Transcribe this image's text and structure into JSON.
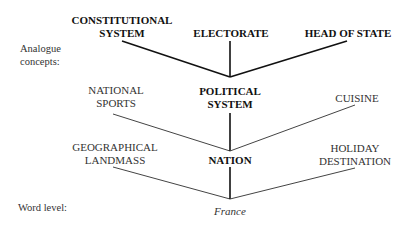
{
  "side_labels": {
    "analogue": [
      "Analogue",
      "concepts:"
    ],
    "word_level": "Word level:"
  },
  "level_top": {
    "nodes": [
      {
        "lines": [
          "CONSTITUTIONAL",
          "SYSTEM"
        ]
      },
      {
        "lines": [
          "ELECTORATE"
        ]
      },
      {
        "lines": [
          "HEAD OF STATE"
        ]
      }
    ]
  },
  "level_mid": {
    "center": [
      "POLITICAL",
      "SYSTEM"
    ],
    "left": [
      "NATIONAL",
      "SPORTS"
    ],
    "right": [
      "CUISINE"
    ]
  },
  "level_low": {
    "center": [
      "NATION"
    ],
    "left": [
      "GEOGRAPHICAL",
      "LANDMASS"
    ],
    "right": [
      "HOLIDAY",
      "DESTINATION"
    ]
  },
  "word": "France",
  "colors": {
    "line_bold": "#111111",
    "line_thin": "#444444",
    "text": "#222222"
  }
}
